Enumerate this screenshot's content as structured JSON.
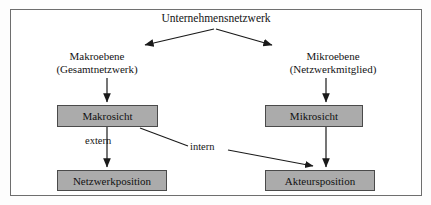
{
  "diagram": {
    "title": "Unternehmensnetzwerk",
    "frame": {
      "border_color": "#6e6e6e",
      "background": "#ffffff"
    },
    "palette": {
      "box_fill": "#ababab",
      "box_border": "#4a4a4a",
      "line_color": "#1a1a1a",
      "text_color": "#141414"
    },
    "branches": {
      "left": {
        "level_label": "Makroebene",
        "scope_label": "(Gesamtnetzwerk)"
      },
      "right": {
        "level_label": "Mikroebene",
        "scope_label": "(Netzwerkmitglied)"
      }
    },
    "boxes": {
      "makrosicht": "Makrosicht",
      "mikrosicht": "Mikrosicht",
      "netzwerkposition": "Netzwerkposition",
      "akteursposition": "Akteursposition"
    },
    "edge_labels": {
      "extern": "extern",
      "intern": "intern"
    }
  }
}
